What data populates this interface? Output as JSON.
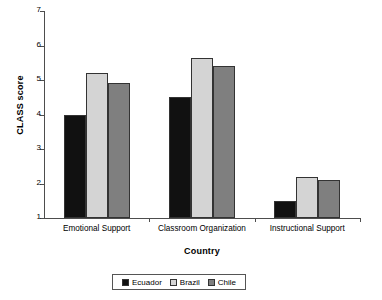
{
  "chart_data": {
    "type": "bar",
    "title": "",
    "xlabel": "Country",
    "ylabel": "CLASS score",
    "categories": [
      "Emotional Support",
      "Classroom Organization",
      "Instructional Support"
    ],
    "series": [
      {
        "name": "Ecuador",
        "color": "#111111",
        "values": [
          4.0,
          4.5,
          1.5
        ]
      },
      {
        "name": "Brazil",
        "color": "#d4d4d4",
        "values": [
          5.2,
          5.65,
          2.2
        ]
      },
      {
        "name": "Chile",
        "color": "#7f7f7f",
        "values": [
          4.9,
          5.4,
          2.1
        ]
      }
    ],
    "ylim": [
      1,
      7
    ],
    "yticks": [
      1,
      2,
      3,
      4,
      5,
      6,
      7
    ],
    "ytick_labels": [
      "1",
      "2",
      "3",
      "4",
      "5",
      "6",
      "7"
    ],
    "grid": false,
    "legend_position": "bottom"
  },
  "legend": {
    "items": [
      {
        "label": "Ecuador",
        "color": "#111111"
      },
      {
        "label": "Brazil",
        "color": "#d4d4d4"
      },
      {
        "label": "Chile",
        "color": "#7f7f7f"
      }
    ]
  }
}
